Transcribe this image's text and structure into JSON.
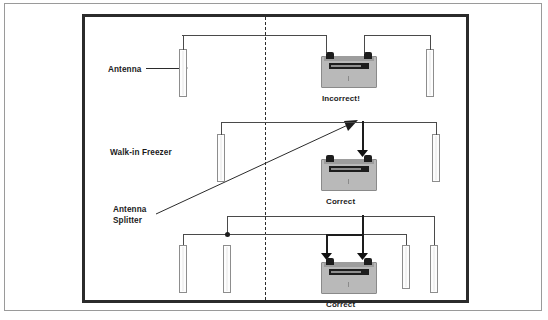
{
  "diagram": {
    "room_label": "Walk-in Freezer",
    "annotations": [
      {
        "id": "antenna",
        "text": "Antenna",
        "pointer": "arrow-right"
      },
      {
        "id": "walk-in-freezer",
        "text": "Walk-in Freezer",
        "pointer": "none"
      },
      {
        "id": "antenna-splitter-line1",
        "text": "Antenna",
        "pointer": "diagonal-arrow"
      },
      {
        "id": "antenna-splitter-line2",
        "text": "Splitter",
        "pointer": "none"
      }
    ],
    "rows": [
      {
        "id": "row-top",
        "caption": "Incorrect!",
        "verdict": "incorrect",
        "antenna_count": 2,
        "splitter_count": 0,
        "description": "Two antennas wired separately to each radio connector without a splitter"
      },
      {
        "id": "row-middle",
        "caption": "Correct",
        "verdict": "correct",
        "antenna_count": 2,
        "splitter_count": 1,
        "description": "Two antennas joined by one antenna splitter feeding the radio"
      },
      {
        "id": "row-bottom",
        "caption": "Correct",
        "verdict": "correct",
        "antenna_count": 4,
        "splitter_count": 2,
        "description": "Four antennas joined through two cascaded antenna splitters feeding the radio"
      }
    ],
    "colors": {
      "frame": "#9a9a9a",
      "room_outline": "#2b2b2b",
      "wire": "#4a4a4a",
      "splitter": "#111111",
      "device_body": "#b9b9b9",
      "device_screen": "#1d1d1d",
      "antenna_fill": "#fdfdfd",
      "text": "#1b1b1b"
    }
  }
}
